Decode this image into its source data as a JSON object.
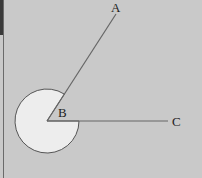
{
  "diagram": {
    "type": "reflex-angle",
    "background": "#c9c9c9",
    "sector_fill": "#ededed",
    "stroke": "#555555",
    "points": {
      "A": {
        "label": "A",
        "x": 116,
        "y": 14,
        "label_x": 111,
        "label_y": 12
      },
      "B": {
        "label": "B",
        "x": 47,
        "y": 121,
        "label_x": 58,
        "label_y": 117
      },
      "C": {
        "label": "C",
        "x": 168,
        "y": 121,
        "label_x": 172,
        "label_y": 126
      }
    },
    "arc_radius": 32,
    "rays": [
      "BA",
      "BC"
    ],
    "marked_angle": "reflex ABC"
  }
}
